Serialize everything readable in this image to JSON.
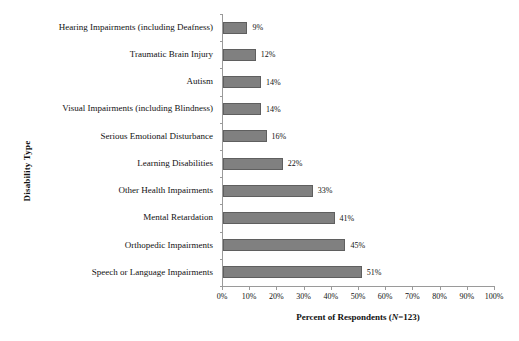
{
  "chart_data": {
    "type": "bar",
    "orientation": "horizontal",
    "title": "",
    "xlabel": "Percent of Respondents (N=123)",
    "ylabel": "Disability Type",
    "categories": [
      "Hearing Impairments (including Deafness)",
      "Traumatic Brain Injury",
      "Autism",
      "Visual Impairments (including Blindness)",
      "Serious Emotional Disturbance",
      "Learning Disabilities",
      "Other Health Impairments",
      "Mental Retardation",
      "Orthopedic Impairments",
      "Speech or Language Impairments"
    ],
    "values": [
      9,
      12,
      14,
      14,
      16,
      22,
      33,
      41,
      45,
      51
    ],
    "value_labels": [
      "9%",
      "12%",
      "14%",
      "14%",
      "16%",
      "22%",
      "33%",
      "41%",
      "45%",
      "51%"
    ],
    "xlim": [
      0,
      100
    ],
    "xticks": [
      0,
      10,
      20,
      30,
      40,
      50,
      60,
      70,
      80,
      90,
      100
    ],
    "xtick_labels": [
      "0%",
      "10%",
      "20%",
      "30%",
      "40%",
      "50%",
      "60%",
      "70%",
      "80%",
      "90%",
      "100%"
    ],
    "grid": false,
    "legend": "none",
    "bar_color": "#808080",
    "bar_border_color": "#5f5f5f",
    "axis_color": "#9a9a9a",
    "text_color": "#111111",
    "background": "#ffffff",
    "sample_size_prefix": "Percent of Respondents (",
    "sample_size_italic": "N",
    "sample_size_suffix": "=123)"
  }
}
